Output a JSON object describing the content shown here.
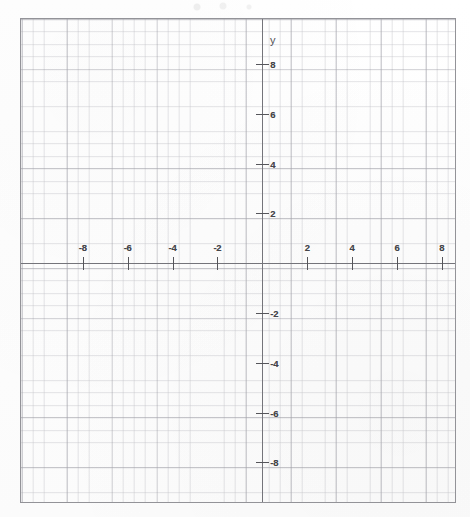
{
  "document": {
    "kind": "coordinate-grid-worksheet",
    "axis_label_y": "y"
  },
  "chart_data": {
    "type": "scatter",
    "title": "",
    "subtitle": "",
    "xlabel": "",
    "ylabel": "y",
    "xlim": [
      -9.7,
      9.7
    ],
    "ylim": [
      -9.8,
      9.8
    ],
    "grid": true,
    "grid_major_step": 2,
    "grid_minor_step": 0.5,
    "legend": "none",
    "series": [],
    "x_tick_labels": [
      "-8",
      "-6",
      "-4",
      "-2",
      "2",
      "4",
      "6",
      "8"
    ],
    "x_tick_values": [
      -8,
      -6,
      -4,
      -2,
      2,
      4,
      6,
      8
    ],
    "y_tick_labels": [
      "8",
      "6",
      "4",
      "2",
      "-2",
      "-4",
      "-6",
      "-8"
    ],
    "y_tick_values": [
      8,
      6,
      4,
      2,
      -2,
      -4,
      -6,
      -8
    ],
    "origin_label": "",
    "annotations": []
  },
  "plot": {
    "x_ticks": [
      {
        "label": "-8",
        "value": -8
      },
      {
        "label": "-6",
        "value": -6
      },
      {
        "label": "-4",
        "value": -4
      },
      {
        "label": "-2",
        "value": -2
      },
      {
        "label": "2",
        "value": 2
      },
      {
        "label": "4",
        "value": 4
      },
      {
        "label": "6",
        "value": 6
      },
      {
        "label": "8",
        "value": 8
      }
    ],
    "y_ticks": [
      {
        "label": "8",
        "value": 8
      },
      {
        "label": "6",
        "value": 6
      },
      {
        "label": "4",
        "value": 4
      },
      {
        "label": "2",
        "value": 2
      },
      {
        "label": "-2",
        "value": -2
      },
      {
        "label": "-4",
        "value": -4
      },
      {
        "label": "-6",
        "value": -6
      },
      {
        "label": "-8",
        "value": -8
      }
    ]
  },
  "colors": {
    "paper": "#fefefe",
    "frame": "#8e8e93",
    "axis": "#6d6d73",
    "tick": "#4c4c52",
    "label_text": "#3b3b41",
    "grid_major": "#787884",
    "grid_minor": "#8c8c96"
  }
}
